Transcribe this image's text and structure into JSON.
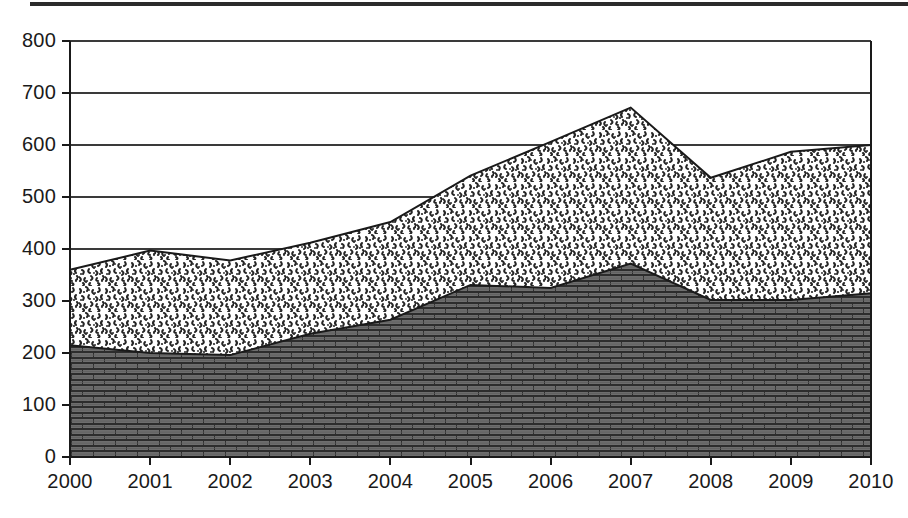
{
  "figure": {
    "title": "",
    "top_rule_color": "#2b2b2b",
    "background": "#ffffff"
  },
  "axes": {
    "y_ticks": [
      "0",
      "100",
      "200",
      "300",
      "400",
      "500",
      "600",
      "700",
      "800"
    ],
    "x_ticks": [
      "2000",
      "2001",
      "2002",
      "2003",
      "2004",
      "2005",
      "2006",
      "2007",
      "2008",
      "2009",
      "2010"
    ],
    "axis_line_color": "#1a1a1a",
    "grid_line_color": "#3a3a3a"
  },
  "series_style": {
    "lower_name": "brick-pattern-series",
    "lower_fill": "#6e6e6e",
    "lower_mortar": "#2e2e2e",
    "upper_name": "speckle-pattern-series",
    "upper_fill": "#ffffff",
    "upper_speckle": "#2a2a2a",
    "outline_color": "#1a1a1a"
  },
  "chart_data": {
    "type": "area",
    "stacked": true,
    "title": "",
    "xlabel": "",
    "ylabel": "",
    "x": [
      2000,
      2001,
      2002,
      2003,
      2004,
      2005,
      2006,
      2007,
      2008,
      2009,
      2010
    ],
    "categories": [
      "2000",
      "2001",
      "2002",
      "2003",
      "2004",
      "2005",
      "2006",
      "2007",
      "2008",
      "2009",
      "2010"
    ],
    "series": [
      {
        "name": "Lower series (dark brick hatch)",
        "pattern": "brick",
        "values": [
          215,
          200,
          196,
          237,
          264,
          331,
          325,
          372,
          302,
          302,
          315
        ]
      },
      {
        "name": "Upper series (light speckle hatch)",
        "pattern": "speckle",
        "values": [
          145,
          197,
          182,
          175,
          188,
          210,
          281,
          300,
          235,
          285,
          285
        ]
      }
    ],
    "cumulative_totals": [
      360,
      397,
      378,
      412,
      452,
      541,
      606,
      672,
      537,
      587,
      600
    ],
    "ylim": [
      0,
      800
    ],
    "xlim": [
      2000,
      2010
    ],
    "ytick_step": 100,
    "grid": "horizontal",
    "legend": "none"
  }
}
